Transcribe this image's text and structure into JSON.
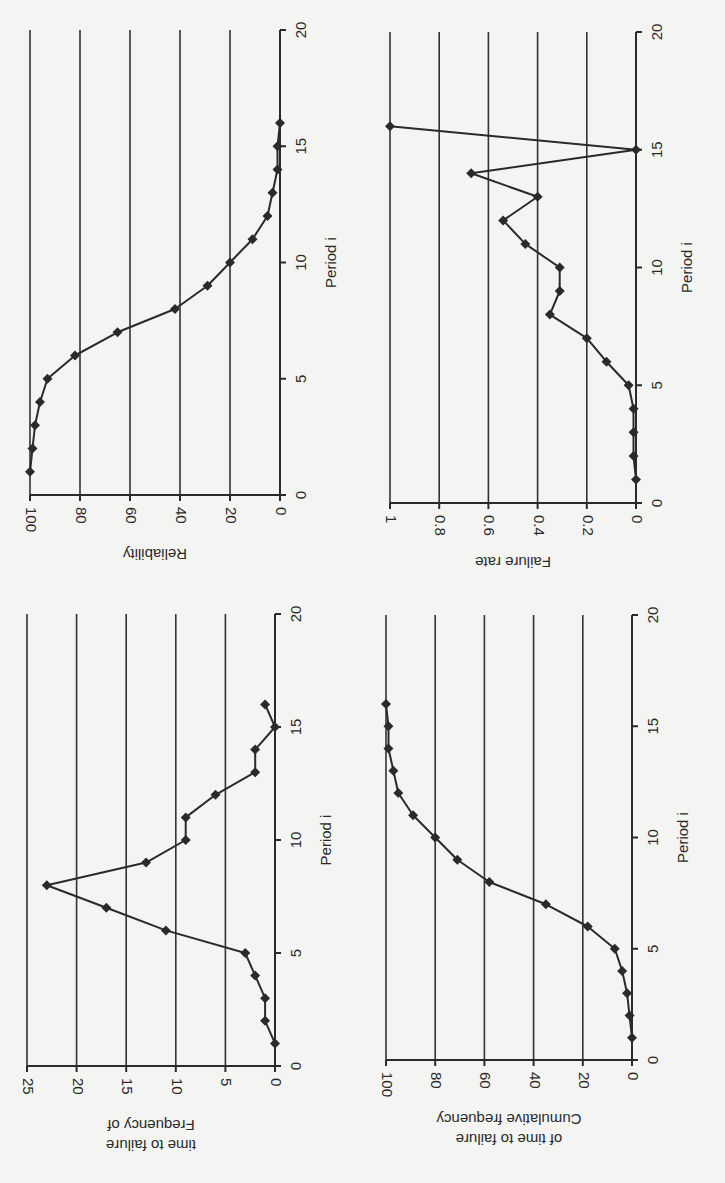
{
  "chart_data": [
    {
      "id": "reliability",
      "type": "line",
      "title": "",
      "xlabel": "Period i",
      "ylabel_lines": [
        "Reliability"
      ],
      "xlim": [
        0,
        20
      ],
      "ylim": [
        0,
        100
      ],
      "xticks": [
        "0",
        "5",
        "10",
        "15",
        "20"
      ],
      "yticks": [
        "0",
        "20",
        "40",
        "60",
        "80",
        "100"
      ],
      "grid": true,
      "marker": "diamond",
      "x": [
        1,
        2,
        3,
        4,
        5,
        6,
        7,
        8,
        9,
        10,
        11,
        12,
        13,
        14,
        15,
        16
      ],
      "values": [
        100,
        99,
        98,
        96,
        93,
        82,
        65,
        42,
        29,
        20,
        11,
        5,
        3,
        1,
        1,
        0
      ]
    },
    {
      "id": "failure-rate",
      "type": "line",
      "title": "",
      "xlabel": "Period i",
      "ylabel_lines": [
        "Failure rate"
      ],
      "xlim": [
        0,
        20
      ],
      "ylim": [
        0,
        1
      ],
      "xticks": [
        "0",
        "5",
        "10",
        "15",
        "20"
      ],
      "yticks": [
        "0",
        "0.2",
        "0.4",
        "0.6",
        "0.8",
        "1"
      ],
      "grid": true,
      "marker": "diamond",
      "x": [
        1,
        2,
        3,
        4,
        5,
        6,
        7,
        8,
        9,
        10,
        11,
        12,
        13,
        14,
        15,
        16
      ],
      "values": [
        0,
        0.01,
        0.01,
        0.01,
        0.03,
        0.12,
        0.2,
        0.35,
        0.31,
        0.31,
        0.45,
        0.54,
        0.4,
        0.67,
        0,
        1
      ]
    },
    {
      "id": "frequency",
      "type": "line",
      "title": "",
      "xlabel": "Period i",
      "ylabel_lines": [
        "Frequency of",
        "time to failure"
      ],
      "xlim": [
        0,
        20
      ],
      "ylim": [
        0,
        25
      ],
      "xticks": [
        "0",
        "5",
        "10",
        "15",
        "20"
      ],
      "yticks": [
        "0",
        "5",
        "10",
        "15",
        "20",
        "25"
      ],
      "grid": true,
      "marker": "diamond",
      "x": [
        1,
        2,
        3,
        4,
        5,
        6,
        7,
        8,
        9,
        10,
        11,
        12,
        13,
        14,
        15,
        16
      ],
      "values": [
        0,
        1,
        1,
        2,
        3,
        11,
        17,
        23,
        13,
        9,
        9,
        6,
        2,
        2,
        0,
        1
      ]
    },
    {
      "id": "cumulative-frequency",
      "type": "line",
      "title": "",
      "xlabel": "Period i",
      "ylabel_lines": [
        "Cumulative frequency",
        "of time to failure"
      ],
      "xlim": [
        0,
        20
      ],
      "ylim": [
        0,
        100
      ],
      "xticks": [
        "0",
        "5",
        "10",
        "15",
        "20"
      ],
      "yticks": [
        "0",
        "20",
        "40",
        "60",
        "80",
        "100"
      ],
      "grid": true,
      "marker": "diamond",
      "x": [
        1,
        2,
        3,
        4,
        5,
        6,
        7,
        8,
        9,
        10,
        11,
        12,
        13,
        14,
        15,
        16
      ],
      "values": [
        0,
        1,
        2,
        4,
        7,
        18,
        35,
        58,
        71,
        80,
        89,
        95,
        97,
        99,
        99,
        100
      ]
    }
  ]
}
